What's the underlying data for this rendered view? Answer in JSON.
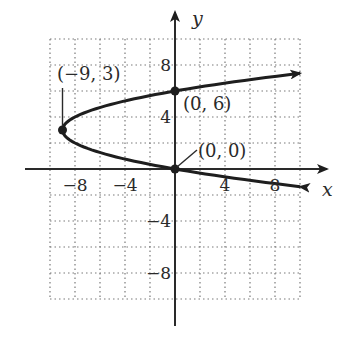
{
  "chart_data": {
    "type": "line",
    "title": "",
    "equation": "x = y^2 - 6y",
    "xlabel": "x",
    "ylabel": "y",
    "xlim": [
      -10,
      10
    ],
    "ylim": [
      -10,
      10
    ],
    "grid": true,
    "grid_step": 2,
    "x_ticks": [
      {
        "value": -8,
        "label": "−8"
      },
      {
        "value": -4,
        "label": "−4"
      },
      {
        "value": 4,
        "label": "4"
      },
      {
        "value": 8,
        "label": "8"
      }
    ],
    "y_ticks": [
      {
        "value": 8,
        "label": "8"
      },
      {
        "value": 4,
        "label": "4"
      },
      {
        "value": -4,
        "label": "−4"
      },
      {
        "value": -8,
        "label": "−8"
      }
    ],
    "series": [
      {
        "name": "parabola",
        "vertex": [
          -9,
          3
        ],
        "y_range": [
          -1.36,
          7.36
        ],
        "arrows": "both ends"
      }
    ],
    "points": [
      {
        "x": -9,
        "y": 3,
        "label": "(−9, 3)"
      },
      {
        "x": 0,
        "y": 6,
        "label": "(0, 6)"
      },
      {
        "x": 0,
        "y": 0,
        "label": "(0, 0)"
      }
    ]
  },
  "colors": {
    "curve": "#1e1e1e",
    "axis": "#2a2a2a",
    "grid": "#7a7a7a",
    "background": "#ffffff"
  }
}
